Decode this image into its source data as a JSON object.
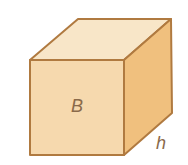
{
  "diagram": {
    "type": "cube",
    "labels": {
      "base": "B",
      "height": "h"
    },
    "colors": {
      "top_face": "#f8e6c8",
      "front_face": "#f6d9ae",
      "side_face": "#f0c07e",
      "edge": "#b07a40",
      "label": "#8a6a4a"
    }
  }
}
